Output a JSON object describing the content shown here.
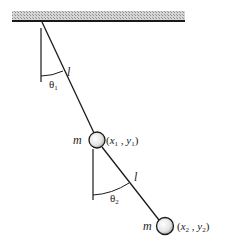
{
  "diagram": {
    "ceiling": {
      "name": "fixed support"
    },
    "rod1": {
      "length_label": "l"
    },
    "angle1": {
      "symbol": "θ",
      "subscript": "1"
    },
    "mass1": {
      "mass_label": "m",
      "coord_open": "(",
      "x": "x",
      "x_sub": "1",
      "sep": " , ",
      "y": "y",
      "y_sub": "1",
      "coord_close": ")"
    },
    "rod2": {
      "length_label": "l"
    },
    "angle2": {
      "symbol": "θ",
      "subscript": "2"
    },
    "mass2": {
      "mass_label": "m",
      "coord_open": "(",
      "x": "x",
      "x_sub": "2",
      "sep": " , ",
      "y": "y",
      "y_sub": "2",
      "coord_close": ")"
    },
    "colors": {
      "line": "#1a1a1a",
      "ceiling_fill": "#bdbdbd",
      "bob_fill": "#d9d9d9"
    }
  }
}
